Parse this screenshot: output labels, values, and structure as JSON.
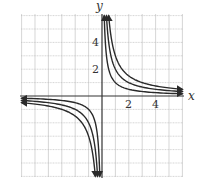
{
  "chart_data": {
    "type": "line",
    "title": "",
    "xlabel": "x",
    "ylabel": "y",
    "xlim": [
      -6,
      6
    ],
    "ylim": [
      -6,
      6
    ],
    "grid": true,
    "x_tick_labels": [
      "2",
      "4"
    ],
    "y_tick_labels": [
      "2",
      "4"
    ],
    "series": [
      {
        "name": "y = 1/x",
        "k": 1
      },
      {
        "name": "y = 2/x",
        "k": 2
      },
      {
        "name": "y = 3/x",
        "k": 3
      }
    ],
    "arrows_on_ends": true,
    "legend": "none"
  },
  "style": {
    "curve_color": "#2a2a2a",
    "axis_color": "#333333",
    "grid_color": "#b8b8b8"
  }
}
